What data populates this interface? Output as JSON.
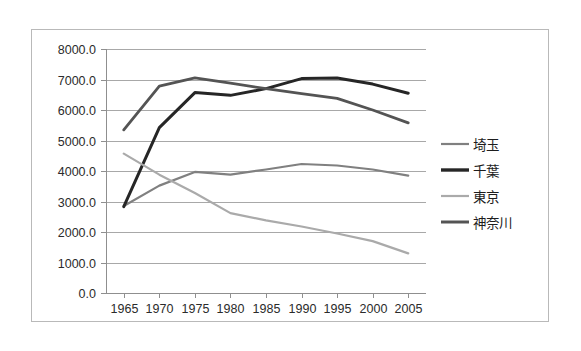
{
  "chart_data": {
    "type": "line",
    "title": "",
    "subtitle": "",
    "xlabel": "",
    "ylabel": "",
    "grid": true,
    "legend_position": "right",
    "categories": [
      "1965",
      "1970",
      "1975",
      "1980",
      "1985",
      "1990",
      "1995",
      "2000",
      "2005"
    ],
    "x": [
      1965,
      1970,
      1975,
      1980,
      1985,
      1990,
      1995,
      2000,
      2005
    ],
    "xlim": [
      1962.5,
      2007.5
    ],
    "ylim": [
      0.0,
      8000.0
    ],
    "ytick_labels": [
      "8000.0",
      "7000.0",
      "6000.0",
      "5000.0",
      "4000.0",
      "3000.0",
      "2000.0",
      "1000.0",
      "0.0"
    ],
    "ytick_values": [
      8000,
      7000,
      6000,
      5000,
      4000,
      3000,
      2000,
      1000,
      0
    ],
    "series": [
      {
        "name": "埼玉",
        "color": "#808080",
        "width": 2.2,
        "values": [
          2850,
          3520,
          3970,
          3880,
          4050,
          4230,
          4180,
          4050,
          3850
        ]
      },
      {
        "name": "千葉",
        "color": "#262626",
        "width": 3.0,
        "values": [
          2830,
          5420,
          6570,
          6480,
          6700,
          7030,
          7050,
          6850,
          6550
        ]
      },
      {
        "name": "東京",
        "color": "#aaaaaa",
        "width": 2.2,
        "values": [
          4570,
          3880,
          3280,
          2620,
          2380,
          2180,
          1950,
          1700,
          1300
        ]
      },
      {
        "name": "神奈川",
        "color": "#545454",
        "width": 2.8,
        "values": [
          5350,
          6780,
          7050,
          6880,
          6700,
          6540,
          6380,
          6000,
          5580
        ]
      }
    ]
  },
  "legend": {
    "items": [
      {
        "label": "埼玉",
        "color": "#808080",
        "width": 2.2
      },
      {
        "label": "千葉",
        "color": "#262626",
        "width": 3.4
      },
      {
        "label": "東京",
        "color": "#aaaaaa",
        "width": 2.2
      },
      {
        "label": "神奈川",
        "color": "#545454",
        "width": 3.0
      }
    ]
  }
}
